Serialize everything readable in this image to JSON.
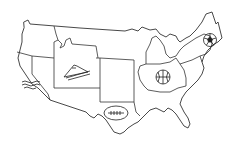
{
  "map": {
    "title": "United States sports map",
    "style": "black line drawing on white",
    "colors": {
      "stroke": "#333333",
      "background": "#ffffff"
    },
    "regions": [
      {
        "id": "northwest",
        "label": "Northwest"
      },
      {
        "id": "california",
        "label": "California",
        "icon": "waves-icon"
      },
      {
        "id": "nevada",
        "label": "Nevada"
      },
      {
        "id": "wyoming-colorado",
        "label": "Colorado",
        "icon": "tent-icon"
      },
      {
        "id": "southwest",
        "label": "Southwest"
      },
      {
        "id": "texas",
        "label": "Texas",
        "icon": "football-icon"
      },
      {
        "id": "midwest",
        "label": "Midwest"
      },
      {
        "id": "michigan",
        "label": "Michigan"
      },
      {
        "id": "ohio-indiana",
        "label": "Ohio",
        "icon": "basketball-icon"
      },
      {
        "id": "northeast",
        "label": "New York",
        "icon": "soccer-ball-icon"
      },
      {
        "id": "southeast",
        "label": "Southeast"
      }
    ],
    "icons": [
      {
        "name": "waves-icon",
        "region": "California"
      },
      {
        "name": "tent-icon",
        "region": "Colorado"
      },
      {
        "name": "football-icon",
        "region": "Texas"
      },
      {
        "name": "basketball-icon",
        "region": "Ohio"
      },
      {
        "name": "soccer-ball-icon",
        "region": "New York"
      }
    ]
  }
}
